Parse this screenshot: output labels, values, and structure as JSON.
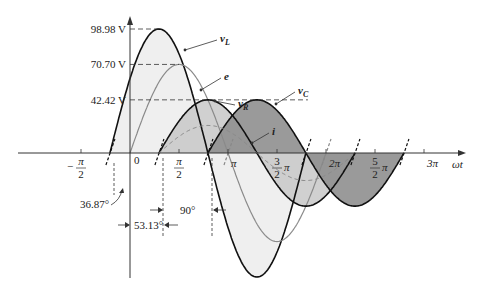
{
  "diagram": {
    "type": "phasor-waveform",
    "axis": {
      "x_label": "ωt",
      "origin_label": "0"
    },
    "ticks": [
      {
        "id": "neg_half_pi",
        "num": "π",
        "den": "2",
        "sign": "−",
        "phase": -0.5
      },
      {
        "id": "half_pi",
        "num": "π",
        "den": "2",
        "sign": "",
        "phase": 0.5
      },
      {
        "id": "pi",
        "text": "π",
        "phase": 1
      },
      {
        "id": "three_half_pi",
        "num": "3",
        "den": "2",
        "suffix": "π",
        "phase": 1.5
      },
      {
        "id": "two_pi",
        "text": "2π",
        "phase": 2
      },
      {
        "id": "five_half_pi",
        "num": "5",
        "den": "2",
        "suffix": "π",
        "phase": 2.5
      },
      {
        "id": "three_pi",
        "text": "3π",
        "phase": 3
      }
    ],
    "levels": [
      {
        "id": "vL_peak",
        "text": "98.98 V",
        "value": 98.98
      },
      {
        "id": "e_peak",
        "text": "70.70 V",
        "value": 70.7
      },
      {
        "id": "vR_peak",
        "text": "42.42 V",
        "value": 42.42
      }
    ],
    "curves": [
      {
        "id": "vL",
        "label": "v",
        "sub": "L",
        "amplitude": 98.98,
        "phase_deg": 36.87,
        "fill": "#ececec",
        "stroke": "#111111"
      },
      {
        "id": "e",
        "label": "e",
        "sub": "",
        "amplitude": 70.7,
        "phase_deg": 0,
        "stroke": "#8a8a8a"
      },
      {
        "id": "vR",
        "label": "v",
        "sub": "R",
        "amplitude": 42.42,
        "phase_deg": -53.13,
        "fill": "#c8c8c8",
        "stroke": "#111111"
      },
      {
        "id": "vC",
        "label": "v",
        "sub": "C",
        "amplitude": 42.42,
        "phase_deg": -143.13,
        "fill": "#8f8f8f",
        "stroke": "#111111"
      },
      {
        "id": "i",
        "label": "i",
        "sub": "",
        "amplitude": 22,
        "phase_deg": -53.13,
        "stroke": "#8a8a8a",
        "dashed": true
      }
    ],
    "annotations": {
      "angle_e_vL": "36.87°",
      "angle_i": "53.13°",
      "angle_quadrature": "90°"
    }
  }
}
